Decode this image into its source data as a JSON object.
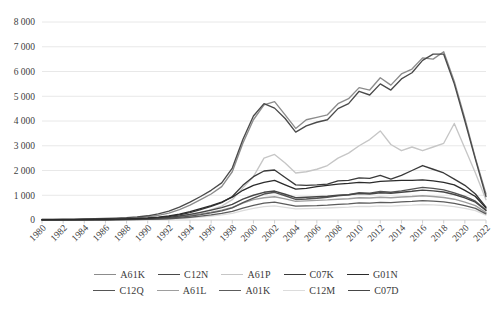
{
  "chart_data": {
    "type": "line",
    "title": "",
    "subtitle": "",
    "xlabel": "",
    "ylabel": "",
    "grid": true,
    "legend_position": "bottom",
    "ylim": [
      0,
      8000
    ],
    "y_ticks": [
      0,
      1000,
      2000,
      3000,
      4000,
      5000,
      6000,
      7000,
      8000
    ],
    "y_tick_labels": [
      "0",
      "1 000",
      "2 000",
      "3 000",
      "4 000",
      "5 000",
      "6 000",
      "7 000",
      "8 000"
    ],
    "x": [
      1980,
      1981,
      1982,
      1983,
      1984,
      1985,
      1986,
      1987,
      1988,
      1989,
      1990,
      1991,
      1992,
      1993,
      1994,
      1995,
      1996,
      1997,
      1998,
      1999,
      2000,
      2001,
      2002,
      2003,
      2004,
      2005,
      2006,
      2007,
      2008,
      2009,
      2010,
      2011,
      2012,
      2013,
      2014,
      2015,
      2016,
      2017,
      2018,
      2019,
      2020,
      2021,
      2022
    ],
    "x_tick_labels": [
      "1980",
      "1982",
      "1984",
      "1986",
      "1988",
      "1990",
      "1992",
      "1994",
      "1996",
      "1998",
      "2000",
      "2002",
      "2004",
      "2006",
      "2008",
      "2010",
      "2012",
      "2014",
      "2016",
      "2018",
      "2020",
      "2022"
    ],
    "series": [
      {
        "name": "A61K",
        "color": "#8c8c8c",
        "values": [
          20,
          22,
          25,
          28,
          32,
          38,
          45,
          55,
          70,
          95,
          130,
          190,
          280,
          420,
          600,
          820,
          1050,
          1350,
          1950,
          3100,
          4050,
          4650,
          4780,
          4250,
          3700,
          4050,
          4150,
          4250,
          4700,
          4900,
          5350,
          5250,
          5750,
          5450,
          5900,
          6100,
          6550,
          6500,
          6800,
          5600,
          4100,
          2500,
          1050
        ]
      },
      {
        "name": "C12N",
        "color": "#4a4a4a",
        "values": [
          25,
          28,
          32,
          36,
          42,
          50,
          60,
          75,
          95,
          125,
          170,
          250,
          360,
          520,
          720,
          950,
          1200,
          1500,
          2100,
          3250,
          4200,
          4700,
          4520,
          4100,
          3550,
          3800,
          3950,
          4050,
          4500,
          4700,
          5200,
          5050,
          5500,
          5250,
          5700,
          5950,
          6450,
          6700,
          6700,
          5500,
          4000,
          2450,
          950
        ]
      },
      {
        "name": "A61P",
        "color": "#c6c6c6",
        "values": [
          5,
          5,
          6,
          7,
          8,
          10,
          12,
          15,
          20,
          28,
          40,
          60,
          90,
          140,
          210,
          300,
          420,
          560,
          820,
          1300,
          1750,
          2500,
          2650,
          2300,
          1900,
          1950,
          2050,
          2200,
          2500,
          2700,
          3000,
          3250,
          3600,
          3050,
          2800,
          2950,
          2800,
          2950,
          3100,
          3900,
          2900,
          1900,
          820
        ]
      },
      {
        "name": "C07K",
        "color": "#3a3a3a",
        "values": [
          8,
          9,
          10,
          12,
          14,
          17,
          21,
          27,
          35,
          48,
          66,
          95,
          140,
          210,
          300,
          420,
          550,
          700,
          950,
          1400,
          1750,
          1980,
          2020,
          1720,
          1420,
          1400,
          1420,
          1450,
          1580,
          1600,
          1700,
          1680,
          1800,
          1650,
          1800,
          2000,
          2200,
          2050,
          1900,
          1650,
          1400,
          1050,
          520
        ]
      },
      {
        "name": "G01N",
        "color": "#2b2b2b",
        "values": [
          12,
          13,
          15,
          17,
          20,
          24,
          30,
          38,
          48,
          62,
          82,
          115,
          165,
          240,
          340,
          460,
          580,
          720,
          920,
          1200,
          1400,
          1520,
          1600,
          1420,
          1250,
          1280,
          1350,
          1400,
          1450,
          1480,
          1520,
          1500,
          1560,
          1580,
          1600,
          1600,
          1620,
          1580,
          1520,
          1420,
          1200,
          950,
          480
        ]
      },
      {
        "name": "C12Q",
        "color": "#555555",
        "values": [
          4,
          5,
          5,
          6,
          7,
          9,
          11,
          14,
          18,
          24,
          33,
          48,
          70,
          105,
          155,
          215,
          285,
          370,
          490,
          700,
          880,
          1050,
          1120,
          980,
          830,
          850,
          880,
          920,
          980,
          1020,
          1100,
          1080,
          1150,
          1120,
          1180,
          1250,
          1320,
          1280,
          1220,
          1100,
          950,
          760,
          400
        ]
      },
      {
        "name": "A61L",
        "color": "#9e9e9e",
        "values": [
          6,
          6,
          7,
          8,
          10,
          12,
          15,
          19,
          24,
          32,
          43,
          62,
          88,
          130,
          185,
          250,
          320,
          400,
          510,
          680,
          820,
          900,
          940,
          850,
          750,
          770,
          790,
          810,
          840,
          860,
          900,
          890,
          920,
          900,
          930,
          950,
          980,
          950,
          910,
          840,
          720,
          580,
          300
        ]
      },
      {
        "name": "A01K",
        "color": "#5c5c5c",
        "values": [
          3,
          3,
          4,
          4,
          5,
          6,
          8,
          10,
          13,
          18,
          25,
          36,
          52,
          78,
          112,
          155,
          205,
          265,
          345,
          480,
          590,
          680,
          720,
          640,
          560,
          570,
          580,
          600,
          630,
          650,
          690,
          680,
          710,
          700,
          730,
          750,
          780,
          760,
          730,
          670,
          580,
          470,
          250
        ]
      },
      {
        "name": "C12M",
        "color": "#dcdcdc",
        "values": [
          2,
          2,
          3,
          3,
          4,
          5,
          6,
          8,
          10,
          14,
          19,
          28,
          40,
          60,
          88,
          122,
          160,
          205,
          270,
          380,
          470,
          540,
          570,
          510,
          450,
          460,
          470,
          485,
          505,
          520,
          550,
          545,
          570,
          560,
          585,
          600,
          625,
          610,
          585,
          540,
          470,
          380,
          200
        ]
      },
      {
        "name": "C07D",
        "color": "#464646",
        "values": [
          7,
          8,
          9,
          10,
          12,
          15,
          18,
          23,
          29,
          39,
          52,
          75,
          108,
          160,
          228,
          310,
          400,
          500,
          630,
          840,
          1000,
          1120,
          1170,
          1040,
          900,
          920,
          940,
          960,
          1000,
          1020,
          1070,
          1050,
          1100,
          1080,
          1120,
          1160,
          1210,
          1180,
          1130,
          1030,
          890,
          720,
          380
        ]
      }
    ]
  },
  "legend": {
    "rows": [
      [
        {
          "label": "A61K",
          "color": "#8c8c8c"
        },
        {
          "label": "C12N",
          "color": "#4a4a4a"
        },
        {
          "label": "A61P",
          "color": "#c6c6c6"
        },
        {
          "label": "C07K",
          "color": "#3a3a3a"
        },
        {
          "label": "G01N",
          "color": "#2b2b2b"
        }
      ],
      [
        {
          "label": "C12Q",
          "color": "#555555"
        },
        {
          "label": "A61L",
          "color": "#9e9e9e"
        },
        {
          "label": "A01K",
          "color": "#5c5c5c"
        },
        {
          "label": "C12M",
          "color": "#dcdcdc"
        },
        {
          "label": "C07D",
          "color": "#464646"
        }
      ]
    ]
  }
}
